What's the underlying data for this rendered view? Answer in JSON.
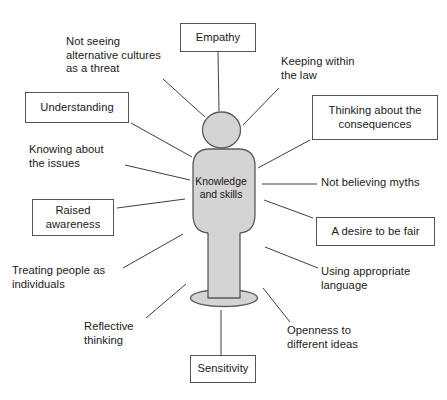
{
  "diagram": {
    "title": "Knowledge and skills",
    "type": "radial-spoke-figure",
    "center": {
      "label": "Knowledge\nand skills",
      "shape": "human-figure",
      "fill_color": "#d4d4d4",
      "stroke_color": "#5a5a5a"
    },
    "style": {
      "line_color": "#3f3f3f",
      "box_border_color": "#545454",
      "background_color": "#ffffff",
      "text_color": "#1a1a1a"
    },
    "nodes": [
      {
        "id": "empathy",
        "label": "Empathy",
        "boxed": true,
        "position": "top-center",
        "x": 180,
        "y": 23,
        "w": 76,
        "h": 29,
        "line": {
          "x1": 218,
          "y1": 52,
          "x2": 219,
          "y2": 111
        }
      },
      {
        "id": "not-seeing-alternative-cultures",
        "label": "Not seeing\nalternative cultures\nas a threat",
        "boxed": false,
        "position": "top-left",
        "x": 66,
        "y": 35,
        "w": 115,
        "h": 44,
        "line": {
          "x1": 163,
          "y1": 79,
          "x2": 205,
          "y2": 117
        }
      },
      {
        "id": "keeping-within-the-law",
        "label": "Keeping within\nthe law",
        "boxed": false,
        "position": "top-right",
        "x": 281,
        "y": 55,
        "w": 104,
        "h": 30,
        "line": {
          "x1": 279,
          "y1": 88,
          "x2": 243,
          "y2": 125
        }
      },
      {
        "id": "understanding",
        "label": "Understanding",
        "boxed": true,
        "position": "left-upper",
        "x": 25,
        "y": 92,
        "w": 104,
        "h": 31,
        "line": {
          "x1": 131,
          "y1": 123,
          "x2": 192,
          "y2": 157
        }
      },
      {
        "id": "thinking-about-the-consequences",
        "label": "Thinking about the\nconsequences",
        "boxed": true,
        "position": "right-upper",
        "x": 312,
        "y": 95,
        "w": 126,
        "h": 45,
        "line": {
          "x1": 310,
          "y1": 140,
          "x2": 258,
          "y2": 168
        }
      },
      {
        "id": "knowing-about-the-issues",
        "label": "Knowing about\nthe issues",
        "boxed": false,
        "position": "left-mid-upper",
        "x": 29,
        "y": 143,
        "w": 100,
        "h": 30,
        "line": {
          "x1": 125,
          "y1": 165,
          "x2": 190,
          "y2": 180
        }
      },
      {
        "id": "not-believing-myths",
        "label": "Not believing myths",
        "boxed": false,
        "position": "right-mid",
        "x": 321,
        "y": 176,
        "w": 115,
        "h": 15,
        "line": {
          "x1": 317,
          "y1": 184,
          "x2": 262,
          "y2": 184
        }
      },
      {
        "id": "raised-awareness",
        "label": "Raised\nawareness",
        "boxed": true,
        "position": "left-mid-lower",
        "x": 32,
        "y": 199,
        "w": 82,
        "h": 37,
        "line": {
          "x1": 117,
          "y1": 208,
          "x2": 185,
          "y2": 199
        }
      },
      {
        "id": "a-desire-to-be-fair",
        "label": "A desire to be fair",
        "boxed": true,
        "position": "right-lower",
        "x": 316,
        "y": 217,
        "w": 119,
        "h": 29,
        "line": {
          "x1": 313,
          "y1": 218,
          "x2": 264,
          "y2": 200
        }
      },
      {
        "id": "treating-people-as-individuals",
        "label": "Treating people as\nindividuals",
        "boxed": false,
        "position": "bottom-left",
        "x": 12,
        "y": 264,
        "w": 115,
        "h": 30,
        "line": {
          "x1": 123,
          "y1": 268,
          "x2": 183,
          "y2": 234
        }
      },
      {
        "id": "using-appropriate-language",
        "label": "Using appropriate\nlanguage",
        "boxed": false,
        "position": "bottom-right",
        "x": 321,
        "y": 265,
        "w": 113,
        "h": 30,
        "line": {
          "x1": 318,
          "y1": 268,
          "x2": 265,
          "y2": 247
        }
      },
      {
        "id": "reflective-thinking",
        "label": "Reflective\nthinking",
        "boxed": false,
        "position": "bottom-left-lower",
        "x": 84,
        "y": 320,
        "w": 75,
        "h": 30,
        "line": {
          "x1": 146,
          "y1": 318,
          "x2": 186,
          "y2": 284
        }
      },
      {
        "id": "openness-to-different-ideas",
        "label": "Openness to\ndifferent ideas",
        "boxed": false,
        "position": "bottom-right-lower",
        "x": 287,
        "y": 324,
        "w": 95,
        "h": 30,
        "line": {
          "x1": 290,
          "y1": 322,
          "x2": 263,
          "y2": 288
        }
      },
      {
        "id": "sensitivity",
        "label": "Sensitivity",
        "boxed": true,
        "position": "bottom-center",
        "x": 190,
        "y": 355,
        "w": 66,
        "h": 28,
        "line": {
          "x1": 221,
          "y1": 355,
          "x2": 221,
          "y2": 310
        }
      }
    ]
  }
}
